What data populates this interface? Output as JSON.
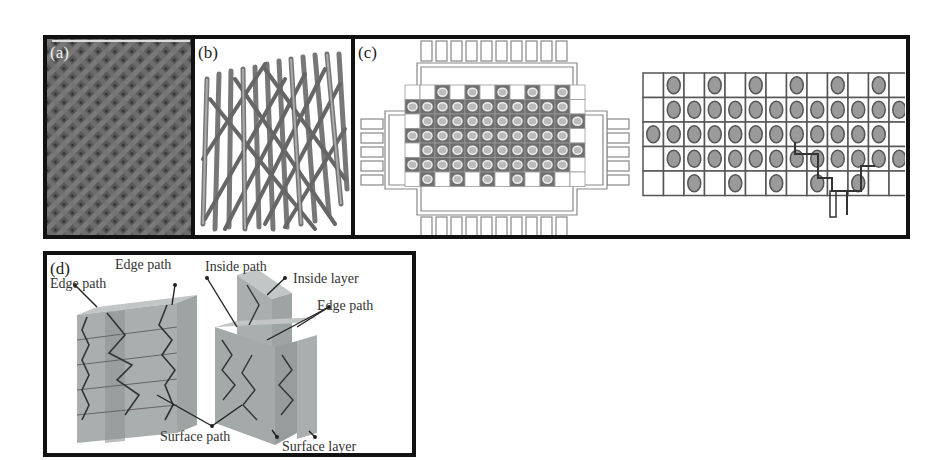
{
  "figure": {
    "panels": [
      {
        "id": "a",
        "label": "(a)",
        "description": "woven fabric texture photograph"
      },
      {
        "id": "b",
        "label": "(b)",
        "description": "3D braided yarn bundle rendering"
      },
      {
        "id": "c",
        "label": "(c)",
        "description": "braiding machine carrier layout and yarn grid with path"
      },
      {
        "id": "d",
        "label": "(d)",
        "description": "3D braided preform structure with labelled paths"
      }
    ],
    "panel_d_annotations": {
      "edge_path_left": "Edge path",
      "edge_path_top": "Edge path",
      "inside_path": "Inside path",
      "inside_layer": "Inside layer",
      "edge_path_right": "Edge path",
      "surface_path": "Surface path",
      "surface_layer": "Surface layer"
    },
    "panel_c_grid": {
      "rows": [
        [
          0,
          1,
          0,
          1,
          0,
          1,
          0,
          1,
          0,
          1,
          0,
          1,
          0
        ],
        [
          0,
          1,
          1,
          1,
          1,
          1,
          1,
          1,
          1,
          1,
          1,
          1,
          1
        ],
        [
          1,
          1,
          1,
          1,
          1,
          1,
          1,
          1,
          1,
          1,
          1,
          1,
          0
        ],
        [
          0,
          1,
          1,
          1,
          1,
          1,
          1,
          1,
          1,
          1,
          1,
          1,
          1
        ],
        [
          0,
          0,
          1,
          0,
          1,
          0,
          1,
          0,
          1,
          0,
          1,
          0,
          0
        ]
      ]
    },
    "colors": {
      "frame": "#111111",
      "fabric": "#6a6a6a",
      "yarn": "#7d7d7d",
      "carrier": "#8a8a8a",
      "block": "#9aa0a0"
    }
  }
}
